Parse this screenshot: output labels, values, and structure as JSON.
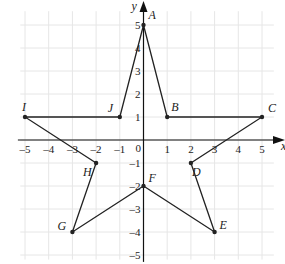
{
  "diagram": {
    "axes": {
      "x_label": "x",
      "y_label": "y",
      "origin_label": "0",
      "x_ticks": [
        "-5",
        "-4",
        "-3",
        "-2",
        "-1",
        "1",
        "2",
        "3",
        "4",
        "5"
      ],
      "y_ticks": [
        "5",
        "4",
        "3",
        "2",
        "1",
        "-1",
        "-2",
        "-3",
        "-4",
        "-5"
      ],
      "range": {
        "x": [
          -5,
          5
        ],
        "y": [
          -5,
          5
        ]
      }
    },
    "points": [
      {
        "name": "A",
        "x": 0,
        "y": 5
      },
      {
        "name": "B",
        "x": 1,
        "y": 1
      },
      {
        "name": "C",
        "x": 5,
        "y": 1
      },
      {
        "name": "D",
        "x": 2,
        "y": -1
      },
      {
        "name": "E",
        "x": 3,
        "y": -4
      },
      {
        "name": "F",
        "x": 0,
        "y": -2
      },
      {
        "name": "G",
        "x": -3,
        "y": -4
      },
      {
        "name": "H",
        "x": -2,
        "y": -1
      },
      {
        "name": "I",
        "x": -5,
        "y": 1
      },
      {
        "name": "J",
        "x": -1,
        "y": 1
      }
    ],
    "polygon_order": [
      "A",
      "B",
      "C",
      "D",
      "E",
      "F",
      "G",
      "H",
      "I",
      "J"
    ],
    "colors": {
      "line": "#222222",
      "grid": "#e6e6e6",
      "axis": "#111111"
    }
  }
}
